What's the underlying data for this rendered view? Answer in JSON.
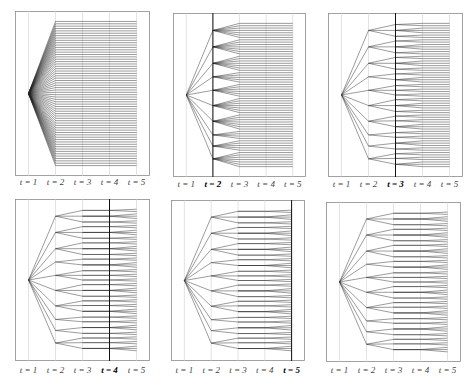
{
  "figure": {
    "stage_labels": [
      "t = 1",
      "t = 2",
      "t = 3",
      "t = 4",
      "t = 5"
    ],
    "colors": {
      "frame": "#8a8a8a",
      "gridline": "#d0d0d0",
      "active_line": "#111111",
      "tree": "#222222",
      "label": "#444444"
    },
    "tree": {
      "root_children": 10,
      "t2_y": [
        0.04,
        0.17,
        0.28,
        0.39,
        0.46,
        0.58,
        0.68,
        0.76,
        0.82,
        0.95
      ],
      "t3_children_per_node": [
        3,
        3,
        3,
        2,
        3,
        3,
        3,
        2,
        2,
        3
      ],
      "leaves_per_t3": [
        2,
        3,
        2,
        2,
        3,
        2,
        2,
        3,
        2,
        2,
        3,
        2,
        2,
        2,
        2,
        3,
        2,
        2,
        2,
        3,
        2,
        2,
        3,
        2,
        2,
        2,
        3
      ]
    },
    "panels": [
      {
        "id": 1,
        "active_stage": 1,
        "box": [
          15,
          11,
          135,
          165
        ],
        "label_y": 183
      },
      {
        "id": 2,
        "active_stage": 2,
        "box": [
          173,
          13,
          133,
          164
        ],
        "label_y": 185
      },
      {
        "id": 3,
        "active_stage": 3,
        "box": [
          328,
          13,
          135,
          164
        ],
        "label_y": 185
      },
      {
        "id": 4,
        "active_stage": 4,
        "box": [
          15,
          199,
          135,
          162
        ],
        "label_y": 371
      },
      {
        "id": 5,
        "active_stage": 5,
        "box": [
          171,
          200,
          134,
          161
        ],
        "label_y": 371
      },
      {
        "id": 6,
        "active_stage": 0,
        "box": [
          326,
          202,
          135,
          160
        ],
        "label_y": 371
      }
    ]
  }
}
